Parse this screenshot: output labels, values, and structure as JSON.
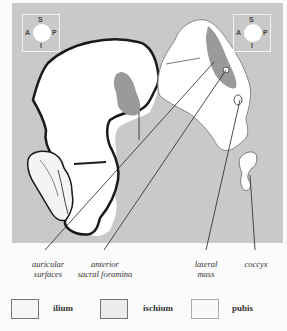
{
  "colors": {
    "panel_bg": "#c9c9c9",
    "bone_fill": "#ffffff",
    "auricular_fill": "#9a9a9a",
    "outline": "#1a1a1a",
    "legend_ilium": "#f6f6f6",
    "legend_ischium": "#ececec",
    "legend_pubis": "#f9f9f9"
  },
  "compass_left": {
    "superior": "S",
    "inferior": "I",
    "anterior": "A",
    "posterior": "P"
  },
  "compass_right": {
    "superior": "S",
    "inferior": "I",
    "anterior": "A",
    "posterior": "P"
  },
  "labels": {
    "auricular_surfaces": {
      "line1": "auricular",
      "line2": "surfaces"
    },
    "anterior_sacral_foramina": {
      "line1": "anterior",
      "line2": "sacral foramina"
    },
    "lateral_mass": {
      "line1": "lateral",
      "line2": "mass"
    },
    "coccyx": {
      "line1": "coccyx"
    }
  },
  "legend": [
    {
      "label": "ilium"
    },
    {
      "label": "ischium"
    },
    {
      "label": "pubis"
    }
  ]
}
